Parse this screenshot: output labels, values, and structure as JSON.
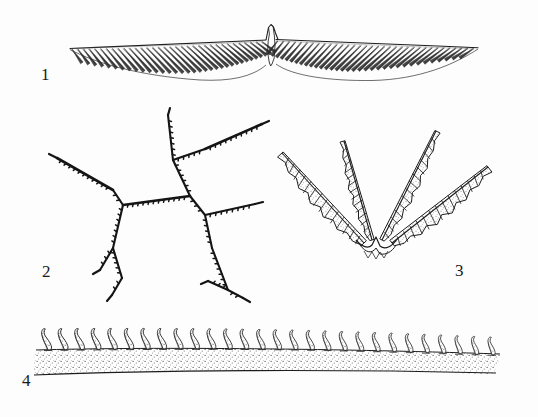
{
  "plate": {
    "title": "",
    "background_color": "#fdfdfd",
    "ink_color": "#1d1d1d",
    "style": "scientific line drawing, stippled pen-and-ink",
    "figure_count": 4
  },
  "figures": [
    {
      "number": "1",
      "name": "bipinnate-wing-structure",
      "description": "Elongated horizontal wing-like element with a thin dorsal margin line and dense oblique barb-like projections hanging below on both sides of a small central upward peak",
      "label_position": {
        "x": 41,
        "y": 66
      },
      "bbox": {
        "x": 60,
        "y": 28,
        "w": 420,
        "h": 60
      },
      "barb_count_left": 34,
      "barb_count_right": 34
    },
    {
      "number": "2",
      "name": "branching-dendritic-structure",
      "description": "Irregular dichotomously branching filament with fine tooth-like serrations along the branches; two main nodes with radiating arms",
      "label_position": {
        "x": 42,
        "y": 263
      },
      "bbox": {
        "x": 50,
        "y": 108,
        "w": 230,
        "h": 190
      },
      "node_count": 4,
      "terminal_branch_count": 7
    },
    {
      "number": "3",
      "name": "four-armed-pinnate-rosette",
      "description": "Four lanceolate pinnate arms radiating upward and outward from a narrow common base, forming a cup; each arm smooth on the outer edge and serrated with stippled shading on the inner edge",
      "label_position": {
        "x": 455,
        "y": 262
      },
      "bbox": {
        "x": 275,
        "y": 135,
        "w": 235,
        "h": 150
      },
      "arm_count": 4
    },
    {
      "number": "4",
      "name": "stippled-band-with-hooks",
      "description": "Broad gently curved stippled band bearing a row of S-curved pointed hook-like spines along its upper margin",
      "label_position": {
        "x": 22,
        "y": 372
      },
      "bbox": {
        "x": 35,
        "y": 310,
        "w": 470,
        "h": 60
      },
      "hook_count": 28
    }
  ],
  "labels": {
    "fig1": "1",
    "fig2": "2",
    "fig3": "3",
    "fig4": "4"
  }
}
